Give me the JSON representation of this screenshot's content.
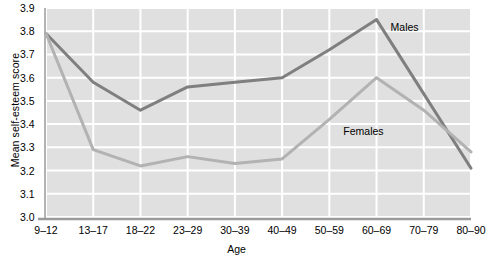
{
  "chart_data": {
    "type": "line",
    "title": "",
    "xlabel": "Age",
    "ylabel": "Mean self-esteem score",
    "categories": [
      "9–12",
      "13–17",
      "18–22",
      "23–29",
      "30–39",
      "40–49",
      "50–59",
      "60–69",
      "70–79",
      "80–90"
    ],
    "yticks": [
      "3.0",
      "3.1",
      "3.2",
      "3.3",
      "3.4",
      "3.5",
      "3.6",
      "3.7",
      "3.8",
      "3.9"
    ],
    "ylim": [
      3.0,
      3.9
    ],
    "grid": true,
    "legend_position": "inline-annotation",
    "series": [
      {
        "name": "Males",
        "color": "#7f7f7f",
        "values": [
          3.79,
          3.58,
          3.46,
          3.56,
          3.58,
          3.6,
          3.72,
          3.85,
          3.53,
          3.21
        ]
      },
      {
        "name": "Females",
        "color": "#b2b2b2",
        "values": [
          3.79,
          3.29,
          3.22,
          3.26,
          3.23,
          3.25,
          3.42,
          3.6,
          3.46,
          3.28
        ]
      }
    ],
    "annotations": [
      {
        "text": "Males",
        "x_category": "60–69",
        "value": 3.82
      },
      {
        "text": "Females",
        "x_category": "50–59",
        "value": 3.37
      }
    ]
  },
  "style": {
    "plot_background": "#e0e0e0",
    "gridline_color": "#ffffff",
    "axis_color": "#9a9a9a",
    "page_background": "#ffffff",
    "text_color": "#000000"
  }
}
